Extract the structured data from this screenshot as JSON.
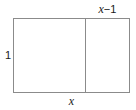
{
  "figure": {
    "type": "geometry-diagram",
    "stroke_color": "#8b8b8b",
    "text_color": "#1a1a1a",
    "background_color": "#ffffff",
    "labels": {
      "top_right_segment": {
        "variable": "x",
        "rest": "−1",
        "full": "x−1"
      },
      "left_side": {
        "full": "1"
      },
      "bottom_side": {
        "variable": "x",
        "full": "x"
      }
    },
    "shapes": {
      "outer_rectangle": {
        "left": 13,
        "top": 18,
        "width": 117,
        "height": 75
      },
      "inner_divider": {
        "x": 85,
        "top": 18,
        "bottom": 93
      }
    }
  }
}
